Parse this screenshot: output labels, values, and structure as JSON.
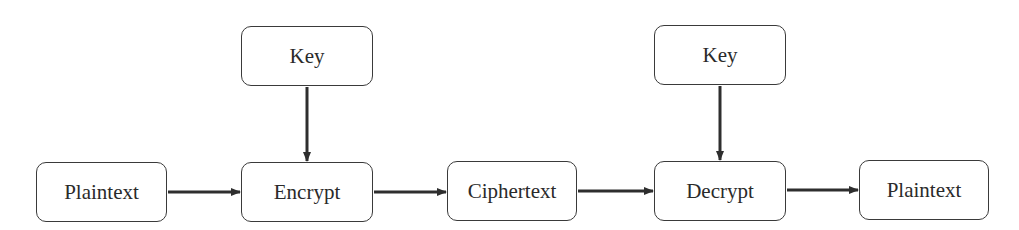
{
  "diagram": {
    "type": "flowchart",
    "title": "",
    "nodes": [
      {
        "id": "plaintext_in",
        "label": "Plaintext",
        "x": 36,
        "y": 162,
        "w": 131,
        "h": 60
      },
      {
        "id": "key_enc",
        "label": "Key",
        "x": 241,
        "y": 26,
        "w": 132,
        "h": 60
      },
      {
        "id": "encrypt",
        "label": "Encrypt",
        "x": 241,
        "y": 162,
        "w": 132,
        "h": 60
      },
      {
        "id": "ciphertext",
        "label": "Ciphertext",
        "x": 447,
        "y": 161,
        "w": 130,
        "h": 60
      },
      {
        "id": "key_dec",
        "label": "Key",
        "x": 654,
        "y": 25,
        "w": 132,
        "h": 60
      },
      {
        "id": "decrypt",
        "label": "Decrypt",
        "x": 654,
        "y": 161,
        "w": 132,
        "h": 60
      },
      {
        "id": "plaintext_out",
        "label": "Plaintext",
        "x": 859,
        "y": 160,
        "w": 130,
        "h": 60
      }
    ],
    "edges": [
      {
        "from": "plaintext_in",
        "to": "encrypt"
      },
      {
        "from": "key_enc",
        "to": "encrypt"
      },
      {
        "from": "encrypt",
        "to": "ciphertext"
      },
      {
        "from": "ciphertext",
        "to": "decrypt"
      },
      {
        "from": "key_dec",
        "to": "decrypt"
      },
      {
        "from": "decrypt",
        "to": "plaintext_out"
      }
    ],
    "colors": {
      "stroke": "#3a3a3a",
      "text": "#2a2a2a",
      "background": "#ffffff"
    }
  }
}
